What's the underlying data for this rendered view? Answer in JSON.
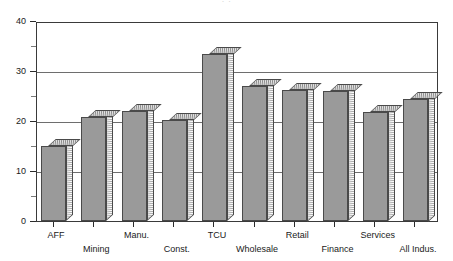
{
  "title_remnant": "· ·",
  "chart_data": {
    "type": "bar",
    "title": "",
    "xlabel": "",
    "ylabel": "",
    "ylim": [
      0,
      40
    ],
    "yticks": [
      0,
      10,
      20,
      30,
      40
    ],
    "yminor": [
      5,
      15,
      25,
      35
    ],
    "grid": true,
    "gridlines": [
      10,
      20,
      30
    ],
    "legend": "none",
    "style": "3d-bar",
    "categories": [
      "AFF",
      "Mining",
      "Manu.",
      "Const.",
      "TCU",
      "Wholesale",
      "Retail",
      "Finance",
      "Services",
      "All Indus."
    ],
    "label_rows": [
      0,
      1,
      0,
      1,
      0,
      1,
      0,
      1,
      0,
      1
    ],
    "values": [
      15.0,
      20.8,
      22.0,
      20.2,
      33.4,
      27.0,
      26.3,
      26.0,
      21.8,
      24.5
    ],
    "colors": {
      "bar_face": "#9a9a9a",
      "bar_edge": "#4a4a4a",
      "bar_top": "#c9c9c9",
      "axis": "#3a3a3a",
      "grid": "#6e6e6e",
      "text": "#1a1a1a",
      "background": "#ffffff"
    }
  }
}
